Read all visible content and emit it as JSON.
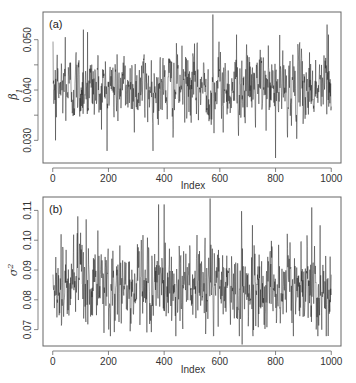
{
  "chart_data": [
    {
      "type": "line",
      "panel_label": "(a)",
      "title": "",
      "xlabel": "Index",
      "ylabel": "β1",
      "ylabel_base": "β",
      "ylabel_sub": "1",
      "x_range": [
        1,
        1000
      ],
      "xlim": [
        -35,
        1035
      ],
      "ylim": [
        0.0255,
        0.0555
      ],
      "x_ticks": [
        0,
        200,
        400,
        600,
        800,
        1000
      ],
      "x_tick_labels": [
        "0",
        "200",
        "400",
        "600",
        "800",
        "1000"
      ],
      "y_ticks": [
        0.03,
        0.035,
        0.04,
        0.045,
        0.05
      ],
      "y_tick_labels": [
        "0.030",
        "",
        "0.040",
        "",
        "0.050"
      ],
      "grid": false,
      "series": [
        {
          "name": "beta1_trace",
          "n": 1000,
          "mean": 0.0405,
          "sd": 0.0035,
          "min": 0.0265,
          "max": 0.055,
          "notable_points": [
            {
              "x": 10,
              "y": 0.03
            },
            {
              "x": 45,
              "y": 0.0505
            },
            {
              "x": 110,
              "y": 0.052
            },
            {
              "x": 125,
              "y": 0.0515
            },
            {
              "x": 575,
              "y": 0.055
            },
            {
              "x": 660,
              "y": 0.051
            },
            {
              "x": 800,
              "y": 0.0265
            },
            {
              "x": 985,
              "y": 0.053
            },
            {
              "x": 990,
              "y": 0.051
            }
          ]
        }
      ]
    },
    {
      "type": "line",
      "panel_label": "(b)",
      "title": "",
      "xlabel": "Index",
      "ylabel": "σ2",
      "ylabel_base": "σ",
      "ylabel_sup": "2",
      "x_range": [
        1,
        1000
      ],
      "xlim": [
        -35,
        1035
      ],
      "ylim": [
        0.0645,
        0.1145
      ],
      "x_ticks": [
        0,
        200,
        400,
        600,
        800,
        1000
      ],
      "x_tick_labels": [
        "0",
        "200",
        "400",
        "600",
        "800",
        "1000"
      ],
      "y_ticks": [
        0.07,
        0.08,
        0.09,
        0.1,
        0.11
      ],
      "y_tick_labels": [
        "0.07",
        "0.08",
        "0.09",
        "0.10",
        "0.11"
      ],
      "grid": false,
      "series": [
        {
          "name": "sigma2_trace",
          "n": 1000,
          "mean": 0.0845,
          "sd": 0.007,
          "min": 0.065,
          "max": 0.114,
          "notable_points": [
            {
              "x": 30,
              "y": 0.102
            },
            {
              "x": 90,
              "y": 0.108
            },
            {
              "x": 120,
              "y": 0.107
            },
            {
              "x": 380,
              "y": 0.112
            },
            {
              "x": 400,
              "y": 0.112
            },
            {
              "x": 565,
              "y": 0.114
            },
            {
              "x": 680,
              "y": 0.065
            },
            {
              "x": 930,
              "y": 0.111
            },
            {
              "x": 960,
              "y": 0.105
            }
          ]
        }
      ]
    }
  ],
  "panels": [
    {
      "label": "(a)",
      "xlabel": "Index"
    },
    {
      "label": "(b)",
      "xlabel": "Index"
    }
  ],
  "colors": {
    "line": "#1a1a1a",
    "axis": "#555555",
    "background": "#ffffff"
  }
}
